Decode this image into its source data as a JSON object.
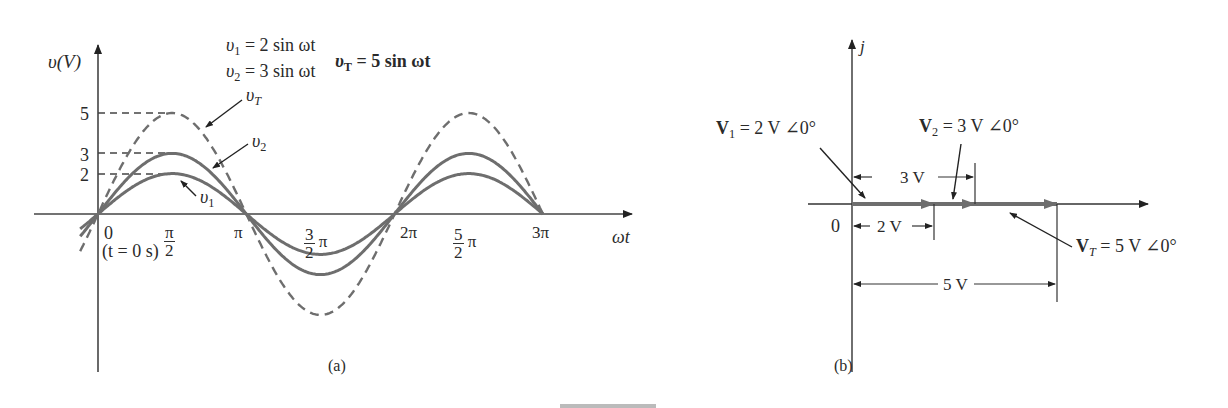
{
  "panel_a": {
    "y_axis_label": "υ(V)",
    "x_axis_label": "ωt",
    "y_ticks": [
      "5",
      "3",
      "2"
    ],
    "x_ticks": {
      "zero": "0",
      "t0": "(t = 0 s)",
      "half_pi_num": "π",
      "half_pi_den": "2",
      "pi": "π",
      "three_half_num": "3",
      "three_half_den": "2",
      "three_half_pi": "π",
      "two_pi": "2π",
      "five_half_num": "5",
      "five_half_den": "2",
      "five_half_pi": "π",
      "three_pi": "3π"
    },
    "equations": {
      "v1_sym": "υ",
      "v1_sub": "1",
      "v1_rhs": " = 2 sin ωt",
      "v2_sym": "υ",
      "v2_sub": "2",
      "v2_rhs": " = 3 sin ωt",
      "vT_sym": "υ",
      "vT_sub": "T",
      "vT_rhs": " = 5 sin ωt"
    },
    "curve_labels": {
      "vT_sym": "υ",
      "vT_sub": "T",
      "v2_sym": "υ",
      "v2_sub": "2",
      "v1_sym": "υ",
      "v1_sub": "1"
    },
    "caption": "(a)"
  },
  "panel_b": {
    "imag_axis_label": "j",
    "origin_label": "0",
    "phasors": {
      "V1_sym": "V",
      "V1_sub": "1",
      "V1_rhs": " = 2 V ∠0°",
      "V2_sym": "V",
      "V2_sub": "2",
      "V2_rhs": " = 3 V ∠0°",
      "VT_sym": "V",
      "VT_sub": "T",
      "VT_rhs": " = 5 V ∠0°"
    },
    "dimensions": {
      "d2": "2 V",
      "d3": "3 V",
      "d5": "5 V"
    },
    "caption": "(b)"
  },
  "figure_caption": "FIG. 14.xx",
  "chart_data": {
    "type": "line",
    "title": "",
    "xlabel": "ωt",
    "ylabel": "υ(V)",
    "x_ticks": [
      "0",
      "π/2",
      "π",
      "3π/2",
      "2π",
      "5π/2",
      "3π"
    ],
    "x": [
      0,
      0.5,
      1,
      1.5,
      2,
      2.5,
      3
    ],
    "x_unit": "π rad",
    "series": [
      {
        "name": "υ1 = 2 sin ωt",
        "style": "solid",
        "values": [
          0,
          2,
          0,
          -2,
          0,
          2,
          0
        ]
      },
      {
        "name": "υ2 = 3 sin ωt",
        "style": "solid",
        "values": [
          0,
          3,
          0,
          -3,
          0,
          3,
          0
        ]
      },
      {
        "name": "υT = 5 sin ωt",
        "style": "dashed",
        "values": [
          0,
          5,
          0,
          -5,
          0,
          5,
          0
        ]
      }
    ],
    "y_ticks": [
      2,
      3,
      5
    ],
    "ylim": [
      -5,
      5
    ],
    "grid": false,
    "phasors": [
      {
        "name": "V1",
        "magnitude": 2,
        "angle_deg": 0
      },
      {
        "name": "V2",
        "magnitude": 3,
        "angle_deg": 0
      },
      {
        "name": "VT",
        "magnitude": 5,
        "angle_deg": 0
      }
    ]
  }
}
